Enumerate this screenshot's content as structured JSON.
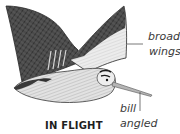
{
  "illustration": {
    "subject": "woodcock-in-flight",
    "caption": "IN FLIGHT",
    "annotations": [
      {
        "id": "wings",
        "lines": [
          "broad",
          "wings"
        ]
      },
      {
        "id": "bill",
        "lines": [
          "bill",
          "angled"
        ]
      }
    ],
    "colors": {
      "wing_dark": "#3b3b3b",
      "wing_light": "#e6e6e6",
      "body": "#dcdcdc",
      "outline": "#2a2a2a",
      "leader_line": "#555555",
      "text": "#3a3a3a"
    }
  }
}
